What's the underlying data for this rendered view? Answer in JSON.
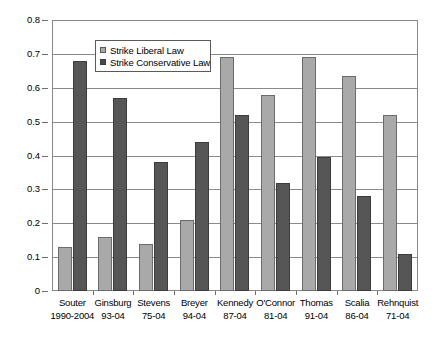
{
  "chart_data": {
    "type": "bar",
    "title": "",
    "xlabel": "",
    "ylabel": "",
    "ylim": [
      0,
      0.8
    ],
    "y_ticks": [
      "0",
      "0.1",
      "0.2",
      "0.3",
      "0.4",
      "0.5",
      "0.6",
      "0.7",
      "0.8"
    ],
    "y_tick_values": [
      0,
      0.1,
      0.2,
      0.3,
      0.4,
      0.5,
      0.6,
      0.7,
      0.8
    ],
    "grid": true,
    "legend_position": "upper-left-inside",
    "categories": [
      "Souter 1990-2004",
      "Ginsburg 93-04",
      "Stevens 75-04",
      "Breyer 94-04",
      "Kennedy 87-04",
      "O'Connor 81-04",
      "Thomas 91-04",
      "Scalia 86-04",
      "Rehnquist 71-04"
    ],
    "category_names": [
      "Souter",
      "Ginsburg",
      "Stevens",
      "Breyer",
      "Kennedy",
      "O'Connor",
      "Thomas",
      "Scalia",
      "Rehnquist"
    ],
    "category_years": [
      "1990-2004",
      "93-04",
      "75-04",
      "94-04",
      "87-04",
      "81-04",
      "91-04",
      "86-04",
      "71-04"
    ],
    "series": [
      {
        "name": "Strike Liberal Law",
        "color": "#a9a9a9",
        "values": [
          0.13,
          0.16,
          0.14,
          0.21,
          0.69,
          0.58,
          0.69,
          0.635,
          0.52
        ]
      },
      {
        "name": "Strike Conservative Law",
        "color": "#565656",
        "values": [
          0.68,
          0.57,
          0.38,
          0.44,
          0.52,
          0.32,
          0.395,
          0.28,
          0.11
        ]
      }
    ]
  },
  "legend": {
    "entries": [
      {
        "label": "Strike Liberal Law"
      },
      {
        "label": "Strike Conservative Law"
      }
    ]
  }
}
